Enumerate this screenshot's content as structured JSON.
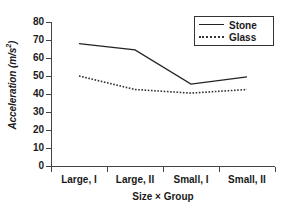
{
  "chart_data": {
    "type": "line",
    "title": "",
    "xlabel": "Size × Group",
    "ylabel": "Acceleration (m/s²)",
    "categories": [
      "Large, I",
      "Large, II",
      "Small, I",
      "Small, II"
    ],
    "series": [
      {
        "name": "Stone",
        "style": "solid",
        "values": [
          68.0,
          64.5,
          45.5,
          49.5
        ]
      },
      {
        "name": "Glass",
        "style": "dotted",
        "values": [
          50.0,
          42.5,
          40.5,
          42.5
        ]
      }
    ],
    "ylim": [
      0,
      80
    ],
    "yticks": [
      0,
      10,
      20,
      30,
      40,
      50,
      60,
      70,
      80
    ],
    "ytick_labels": [
      "0",
      "10",
      "20",
      "30",
      "40",
      "50",
      "60",
      "70",
      "80"
    ],
    "grid": false,
    "legend_position": "top-right",
    "colors": {
      "stone": "#222222",
      "glass": "#333333",
      "axis": "#444444"
    }
  },
  "axes": {
    "y_title_main": "Acceleration (m/s",
    "y_title_sup": "2",
    "y_title_close": ")",
    "x_title": "Size × Group"
  },
  "legend": {
    "items": [
      {
        "label": "Stone"
      },
      {
        "label": "Glass"
      }
    ]
  }
}
